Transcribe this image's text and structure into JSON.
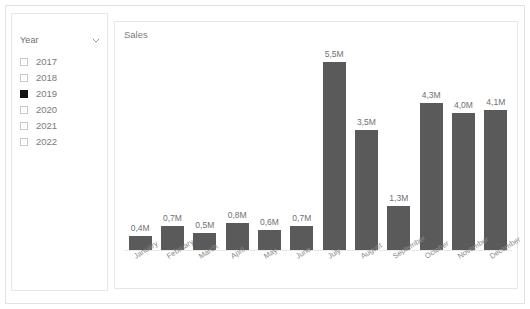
{
  "slicer": {
    "title": "Year",
    "chevron_icon": "chevron-down-icon",
    "items": [
      {
        "label": "2017",
        "checked": false
      },
      {
        "label": "2018",
        "checked": false
      },
      {
        "label": "2019",
        "checked": true
      },
      {
        "label": "2020",
        "checked": false
      },
      {
        "label": "2021",
        "checked": false
      },
      {
        "label": "2022",
        "checked": false
      }
    ]
  },
  "chart": {
    "title": "Sales"
  },
  "colors": {
    "bar": "#5a5a5a",
    "label_text": "#6f6f6f",
    "axis_text": "#8a8a8a",
    "card_border": "#e6e6e6",
    "page_border": "#e2e2e2",
    "checked_box": "#111111"
  },
  "chart_data": {
    "type": "bar",
    "title": "Sales",
    "xlabel": "",
    "ylabel": "",
    "grid": false,
    "legend": false,
    "ylim": [
      0,
      5.5
    ],
    "unit": "M",
    "decimal_separator": ",",
    "categories": [
      "January",
      "February",
      "March",
      "April",
      "May",
      "June",
      "July",
      "August",
      "September",
      "October",
      "November",
      "December"
    ],
    "values": [
      0.4,
      0.7,
      0.5,
      0.8,
      0.6,
      0.7,
      5.5,
      3.5,
      1.3,
      4.3,
      4.0,
      4.1
    ],
    "data_labels": [
      "0,4M",
      "0,7M",
      "0,5M",
      "0,8M",
      "0,6M",
      "0,7M",
      "5,5M",
      "3,5M",
      "1,3M",
      "4,3M",
      "4,0M",
      "4,1M"
    ]
  }
}
